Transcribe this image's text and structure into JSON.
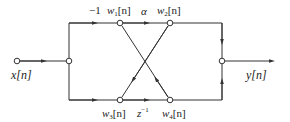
{
  "diagram": {
    "type": "signal-flow-graph",
    "colors": {
      "line": "#333333",
      "node_fill": "#ffffff",
      "text": "#222222"
    },
    "labels": {
      "input": "x[n]",
      "output": "y[n]",
      "w1": "w",
      "w1_sub": "1",
      "w2": "w",
      "w2_sub": "2",
      "w3": "w",
      "w3_sub": "3",
      "w4": "w",
      "w4_sub": "4",
      "index": "[n]",
      "gain_top_left": "−1",
      "gain_top_mid": "α",
      "gain_bottom_mid": "z",
      "gain_bottom_mid_exp": "−1"
    },
    "nodes": [
      {
        "id": "input",
        "x": 17,
        "y": 61
      },
      {
        "id": "split",
        "x": 69,
        "y": 61
      },
      {
        "id": "w1",
        "x": 120,
        "y": 23
      },
      {
        "id": "w2",
        "x": 170,
        "y": 23
      },
      {
        "id": "w3",
        "x": 120,
        "y": 100
      },
      {
        "id": "w4",
        "x": 170,
        "y": 100
      },
      {
        "id": "output",
        "x": 222,
        "y": 61
      }
    ]
  }
}
